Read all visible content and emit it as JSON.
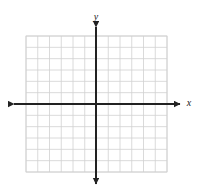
{
  "figure": {
    "kind": "cartesian-coordinate-grid",
    "background_color": "#ffffff"
  },
  "grid": {
    "columns": 12,
    "rows": 12,
    "left": 26,
    "top": 36,
    "right": 167,
    "bottom": 172,
    "cell_width": 11.75,
    "cell_height": 11.33,
    "line_color": "#d0d0d0",
    "line_width": 0.8,
    "border_color": "#d0d0d0"
  },
  "axes": {
    "origin_x": 96,
    "origin_y": 104,
    "color": "#222222",
    "line_width": 2,
    "x_axis": {
      "label": "x",
      "label_x": 189,
      "label_y": 104,
      "start_x": 14,
      "end_x": 180
    },
    "y_axis": {
      "label": "y",
      "label_x": 96,
      "label_y": 18,
      "start_y": 27,
      "end_y": 184
    },
    "arrowheads": [
      "left",
      "right",
      "up",
      "down"
    ]
  }
}
